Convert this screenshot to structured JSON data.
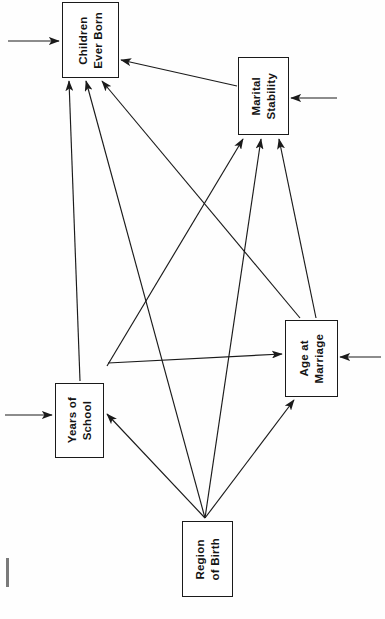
{
  "diagram": {
    "type": "path-diagram",
    "background_color": "#fefefe",
    "line_color": "#1a1a1a",
    "nodes": [
      {
        "id": "children-ever-born",
        "label": "Children\nEver Born",
        "x": 62,
        "y": 2,
        "width": 57,
        "height": 76
      },
      {
        "id": "marital-stability",
        "label": "Marital\nStability",
        "x": 238,
        "y": 57,
        "width": 51,
        "height": 78
      },
      {
        "id": "age-at-marriage",
        "label": "Age at\nMarriage",
        "x": 285,
        "y": 320,
        "width": 53,
        "height": 77
      },
      {
        "id": "years-of-school",
        "label": "Years of\nSchool",
        "x": 55,
        "y": 383,
        "width": 49,
        "height": 75
      },
      {
        "id": "region-of-birth",
        "label": "Region\nof Birth",
        "x": 182,
        "y": 521,
        "width": 51,
        "height": 76
      }
    ],
    "edges": [
      {
        "id": "edge-marital-to-children",
        "from": "marital-stability",
        "to": "children-ever-born",
        "x1": 237,
        "y1": 86,
        "x2": 121,
        "y2": 60
      },
      {
        "id": "edge-age-to-children",
        "from": "age-at-marriage",
        "to": "children-ever-born",
        "x1": 300,
        "y1": 318,
        "x2": 102,
        "y2": 81
      },
      {
        "id": "edge-school-to-children",
        "from": "years-of-school",
        "to": "children-ever-born",
        "x1": 80,
        "y1": 381,
        "x2": 69,
        "y2": 81
      },
      {
        "id": "edge-region-to-children",
        "from": "region-of-birth",
        "to": "children-ever-born",
        "x1": 205,
        "y1": 518,
        "x2": 86,
        "y2": 81
      },
      {
        "id": "edge-school-to-marital",
        "from": "years-of-school",
        "to": "marital-stability",
        "x1": 107,
        "y1": 366,
        "x2": 243,
        "y2": 139
      },
      {
        "id": "edge-region-to-marital",
        "from": "region-of-birth",
        "to": "marital-stability",
        "x1": 205,
        "y1": 518,
        "x2": 261,
        "y2": 139
      },
      {
        "id": "edge-age-to-marital",
        "from": "age-at-marriage",
        "to": "marital-stability",
        "x1": 316,
        "y1": 318,
        "x2": 279,
        "y2": 139
      },
      {
        "id": "edge-school-to-age",
        "from": "years-of-school",
        "to": "age-at-marriage",
        "x1": 108,
        "y1": 363,
        "x2": 282,
        "y2": 354
      },
      {
        "id": "edge-region-to-age",
        "from": "region-of-birth",
        "to": "age-at-marriage",
        "x1": 205,
        "y1": 518,
        "x2": 294,
        "y2": 400
      },
      {
        "id": "edge-region-to-school",
        "from": "region-of-birth",
        "to": "years-of-school",
        "x1": 205,
        "y1": 518,
        "x2": 107,
        "y2": 414
      }
    ],
    "disturbances": [
      {
        "id": "disturbance-children-ever-born",
        "target": "children-ever-born",
        "x1": 8,
        "y1": 41,
        "x2": 59,
        "y2": 41,
        "direction": "right"
      },
      {
        "id": "disturbance-marital-stability",
        "target": "marital-stability",
        "x1": 337,
        "y1": 98,
        "x2": 291,
        "y2": 98,
        "direction": "left"
      },
      {
        "id": "disturbance-age-at-marriage",
        "target": "age-at-marriage",
        "x1": 381,
        "y1": 357,
        "x2": 340,
        "y2": 357,
        "direction": "left"
      },
      {
        "id": "disturbance-years-of-school",
        "target": "years-of-school",
        "x1": 5,
        "y1": 415,
        "x2": 52,
        "y2": 415,
        "direction": "right"
      }
    ],
    "artifacts": [
      {
        "id": "scan-mark-left",
        "x": 6,
        "y": 558,
        "width": 3,
        "height": 29
      }
    ]
  }
}
